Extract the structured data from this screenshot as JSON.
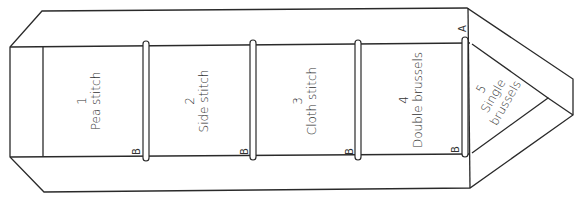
{
  "diagram": {
    "type": "lace-pricking-bobbin-layout",
    "stroke_color": "#2a2a2a",
    "text_color": "#333333",
    "sections": [
      {
        "number": "1",
        "label": "Pea stitch",
        "marker": "B"
      },
      {
        "number": "2",
        "label": "Side stitch",
        "marker": "B"
      },
      {
        "number": "3",
        "label": "Cloth stitch",
        "marker": "B"
      },
      {
        "number": "4",
        "label": "Double brussels",
        "marker": "B"
      },
      {
        "number": "5",
        "label_line1": "Single",
        "label_line2": "brussels"
      }
    ],
    "corner_marker": "A"
  }
}
